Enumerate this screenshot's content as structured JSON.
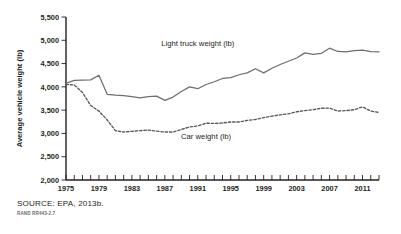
{
  "figure": {
    "source_note": "SOURCE: EPA, 2013b.",
    "rand_id": "RAND RR443-2.7"
  },
  "chart_data": {
    "type": "line",
    "title": "",
    "xlabel": "",
    "ylabel": "Average vehicle weight (lb)",
    "xlim": [
      1975,
      2013
    ],
    "ylim": [
      2000,
      5500
    ],
    "ytick_values": [
      2000,
      2500,
      3000,
      3500,
      4000,
      4500,
      5000,
      5500
    ],
    "ytick_labels": [
      "2,000",
      "2,500",
      "3,000",
      "3,500",
      "4,000",
      "4,500",
      "5,000",
      "5,500"
    ],
    "xtick_values": [
      1975,
      1976,
      1977,
      1978,
      1979,
      1980,
      1981,
      1982,
      1983,
      1984,
      1985,
      1986,
      1987,
      1988,
      1989,
      1990,
      1991,
      1992,
      1993,
      1994,
      1995,
      1996,
      1997,
      1998,
      1999,
      2000,
      2001,
      2002,
      2003,
      2004,
      2005,
      2006,
      2007,
      2008,
      2009,
      2010,
      2011,
      2012,
      2013
    ],
    "xtick_labeled": [
      1975,
      1979,
      1983,
      1987,
      1991,
      1995,
      1999,
      2003,
      2007,
      2011
    ],
    "xtick_labels": [
      "1975",
      "1979",
      "1983",
      "1987",
      "1991",
      "1995",
      "1999",
      "2003",
      "2007",
      "2011"
    ],
    "grid": false,
    "legend_position": "inline-annotations",
    "x": [
      1975,
      1976,
      1977,
      1978,
      1979,
      1980,
      1981,
      1982,
      1983,
      1984,
      1985,
      1986,
      1987,
      1988,
      1989,
      1990,
      1991,
      1992,
      1993,
      1994,
      1995,
      1996,
      1997,
      1998,
      1999,
      2000,
      2001,
      2002,
      2003,
      2004,
      2005,
      2006,
      2007,
      2008,
      2009,
      2010,
      2011,
      2012,
      2013
    ],
    "series": [
      {
        "name": "Light truck weight (lb)",
        "style": "solid",
        "label_text": "Light truck weight (lb)",
        "label_x": 1991,
        "label_y": 4880,
        "values": [
          4075,
          4140,
          4145,
          4150,
          4250,
          3840,
          3820,
          3810,
          3790,
          3765,
          3790,
          3800,
          3710,
          3780,
          3900,
          4000,
          3960,
          4050,
          4110,
          4180,
          4200,
          4260,
          4300,
          4390,
          4300,
          4400,
          4480,
          4550,
          4620,
          4730,
          4700,
          4720,
          4830,
          4760,
          4750,
          4780,
          4790,
          4755,
          4750
        ]
      },
      {
        "name": "Car weight (lb)",
        "style": "dashed",
        "label_text": "Car weight (lb)",
        "label_x": 1992,
        "label_y": 2880,
        "values": [
          4050,
          4040,
          3880,
          3600,
          3480,
          3290,
          3060,
          3030,
          3045,
          3060,
          3070,
          3050,
          3030,
          3030,
          3085,
          3140,
          3160,
          3220,
          3215,
          3225,
          3245,
          3245,
          3280,
          3300,
          3340,
          3370,
          3400,
          3420,
          3465,
          3490,
          3510,
          3540,
          3545,
          3480,
          3490,
          3510,
          3570,
          3480,
          3450
        ]
      }
    ]
  }
}
